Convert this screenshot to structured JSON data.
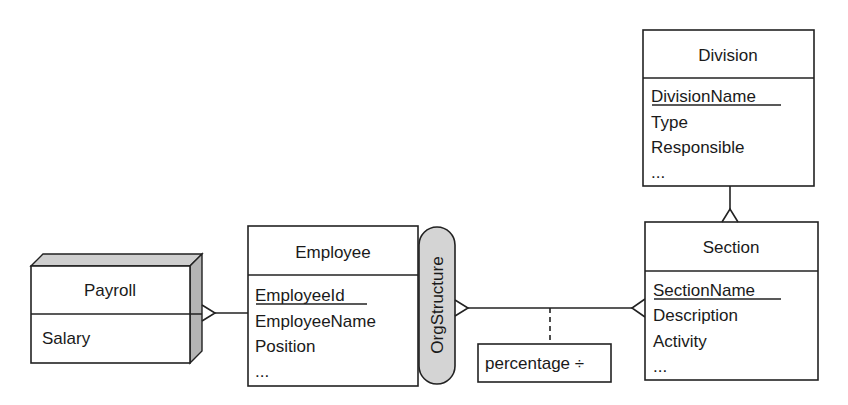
{
  "diagram": {
    "type": "entity-relationship",
    "entities": [
      {
        "id": "payroll",
        "name": "Payroll",
        "style": "3d-shaded",
        "attributes": [
          {
            "label": "Salary",
            "key": false
          }
        ]
      },
      {
        "id": "employee",
        "name": "Employee",
        "attributes": [
          {
            "label": "EmployeeId",
            "key": true
          },
          {
            "label": "EmployeeName",
            "key": false
          },
          {
            "label": "Position",
            "key": false
          },
          {
            "label": "...",
            "key": false
          }
        ]
      },
      {
        "id": "section",
        "name": "Section",
        "attributes": [
          {
            "label": "SectionName",
            "key": true
          },
          {
            "label": "Description",
            "key": false
          },
          {
            "label": "Activity",
            "key": false
          },
          {
            "label": "...",
            "key": false
          }
        ]
      },
      {
        "id": "division",
        "name": "Division",
        "attributes": [
          {
            "label": "DivisionName",
            "key": true
          },
          {
            "label": "Type",
            "key": false
          },
          {
            "label": "Responsible",
            "key": false
          },
          {
            "label": "...",
            "key": false
          }
        ]
      }
    ],
    "role_label": "OrgStructure",
    "relationship_attribute": "percentage ÷",
    "relationships": [
      {
        "from": "Payroll",
        "to": "Employee",
        "from_end": "many",
        "to_end": "one"
      },
      {
        "from": "Employee",
        "to": "Section",
        "via": "OrgStructure",
        "from_end": "many",
        "to_end": "many",
        "attribute": "percentage ÷"
      },
      {
        "from": "Division",
        "to": "Section",
        "from_end": "one",
        "to_end": "many"
      }
    ]
  }
}
